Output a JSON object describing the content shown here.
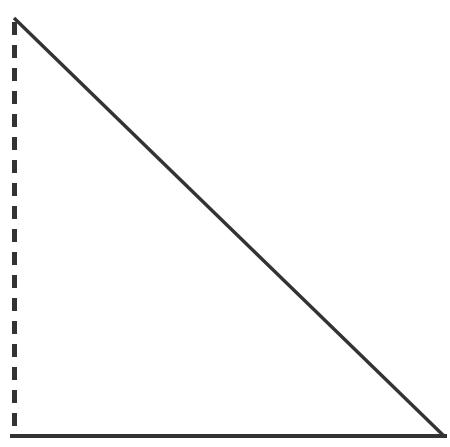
{
  "figure": {
    "title": "",
    "background_color": "#ffffff",
    "width": 450,
    "height": 447,
    "stroke_color": "#333333",
    "shape_name": "right-triangle"
  },
  "chart_data": {
    "type": "line",
    "title": "",
    "subtitle": "",
    "xlabel": "",
    "ylabel": "",
    "grid": false,
    "legend": null,
    "xlim": [
      0,
      450
    ],
    "ylim": [
      0,
      447
    ],
    "annotations": [],
    "tick_labels": {
      "x": [],
      "y": []
    },
    "series": [
      {
        "name": "left-leg",
        "style": "dashed",
        "color": "#333333",
        "linewidth": 5,
        "dash_length": 13,
        "dash_gap": 10,
        "x": [
          14.5,
          14.5
        ],
        "y": [
          22,
          433
        ]
      },
      {
        "name": "hypotenuse",
        "style": "solid",
        "color": "#333333",
        "linewidth": 3.4,
        "x": [
          14,
          445
        ],
        "y": [
          18,
          437
        ]
      },
      {
        "name": "bottom-leg",
        "style": "solid",
        "color": "#333333",
        "linewidth": 4.2,
        "x": [
          10,
          447
        ],
        "y": [
          436,
          436
        ]
      }
    ]
  }
}
